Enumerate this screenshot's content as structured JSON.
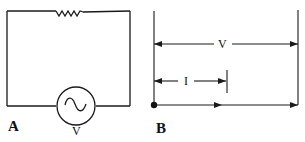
{
  "figure": {
    "panels": [
      {
        "id": "A",
        "label": "A",
        "description": "AC series circuit with resistor and AC voltage source",
        "components": {
          "resistor": {
            "label": ""
          },
          "source": {
            "type": "AC",
            "label": "V"
          }
        }
      },
      {
        "id": "B",
        "label": "B",
        "description": "Phasor diagram: voltage and current in phase",
        "vectors": [
          {
            "name": "voltage",
            "label": "V",
            "direction": "right"
          },
          {
            "name": "current",
            "label": "I",
            "direction": "right"
          }
        ]
      }
    ],
    "colors": {
      "ink": "#1a1a1a",
      "background": "#ffffff"
    }
  }
}
